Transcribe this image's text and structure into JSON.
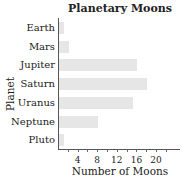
{
  "chart_data": {
    "type": "bar",
    "orientation": "horizontal",
    "title": "Planetary Moons",
    "xlabel": "Number of Moons",
    "ylabel": "Planet",
    "categories": [
      "Earth",
      "Mars",
      "Jupiter",
      "Saturn",
      "Uranus",
      "Neptune",
      "Pluto"
    ],
    "values": [
      1,
      2,
      16,
      18,
      15,
      8,
      1
    ],
    "xlim": [
      0,
      25
    ],
    "xticks": [
      4,
      8,
      12,
      16,
      20
    ],
    "bar_color": "#e6e6e6",
    "grid": false
  }
}
